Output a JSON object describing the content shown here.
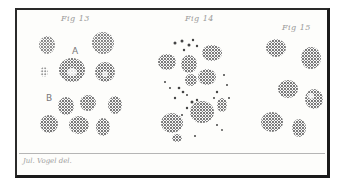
{
  "plate": {
    "figures": [
      {
        "label": "Fig 13",
        "sublabels": [
          "A",
          "B"
        ]
      },
      {
        "label": "Fig 14"
      },
      {
        "label": "Fig 15"
      }
    ],
    "caption": "Jul. Vogel del."
  },
  "colors": {
    "ink": "#3a3a3a",
    "border": "#1f1f1f",
    "paper": "#fdfdfb"
  }
}
